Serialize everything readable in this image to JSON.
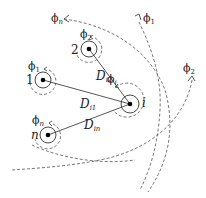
{
  "diagram": {
    "nodes": [
      {
        "id": "1",
        "label": "1",
        "phase_label": "ϕ",
        "phase_sub": "1",
        "x": 43,
        "y": 80
      },
      {
        "id": "2",
        "label": "2",
        "phase_label": "ϕ",
        "phase_sub": "2",
        "x": 89,
        "y": 49
      },
      {
        "id": "i",
        "label": "i",
        "phase_label": "ϕ",
        "phase_sub": "i",
        "x": 130,
        "y": 104
      },
      {
        "id": "n",
        "label": "n",
        "phase_label": "ϕ",
        "phase_sub": "n",
        "x": 48,
        "y": 135
      }
    ],
    "edges": [
      {
        "from": "i",
        "to": "1",
        "label": "D",
        "sub": "i1"
      },
      {
        "from": "i",
        "to": "2",
        "label": "D",
        "sub": "i2"
      },
      {
        "from": "i",
        "to": "n",
        "label": "D",
        "sub": "in"
      }
    ],
    "wavefronts": [
      {
        "label": "ϕ",
        "sub": "n"
      },
      {
        "label": "ϕ",
        "sub": "1"
      },
      {
        "label": "ϕ",
        "sub": "2"
      }
    ]
  }
}
